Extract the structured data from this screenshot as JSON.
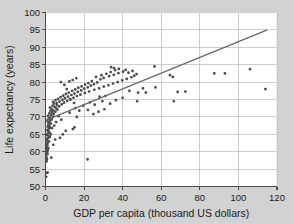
{
  "chart_data": {
    "type": "scatter",
    "title": "",
    "xlabel": "GDP per capita (thousand US dollars)",
    "ylabel": "Life expectancy (years)",
    "xlim": [
      0,
      120
    ],
    "ylim": [
      50,
      100
    ],
    "xticks": [
      0,
      20,
      40,
      60,
      80,
      100,
      120
    ],
    "yticks": [
      50,
      55,
      60,
      65,
      70,
      75,
      80,
      85,
      90,
      95,
      100
    ],
    "xtick_labels": [
      "0",
      "20",
      "40",
      "60",
      "80",
      "100",
      "120"
    ],
    "ytick_labels": [
      "50",
      "55",
      "60",
      "65",
      "70",
      "75",
      "80",
      "85",
      "90",
      "95",
      "100"
    ],
    "grid": true,
    "grid_color": "#b9b9b9",
    "point_color": "#4d4d4d",
    "trend_color": "#6a6a6a",
    "background_color": "#d2d2d2",
    "plot_background_color": "#ffffff",
    "trend_line": {
      "x": [
        0,
        115
      ],
      "y": [
        69.0,
        95.0
      ]
    },
    "points": [
      [
        0.4,
        52.8
      ],
      [
        0.6,
        53.9
      ],
      [
        1.1,
        54.0
      ],
      [
        0.5,
        57.2
      ],
      [
        0.7,
        58.0
      ],
      [
        0.4,
        58.6
      ],
      [
        0.9,
        59.3
      ],
      [
        0.6,
        60.1
      ],
      [
        1.2,
        60.4
      ],
      [
        0.8,
        60.9
      ],
      [
        0.5,
        61.4
      ],
      [
        1.0,
        61.8
      ],
      [
        0.7,
        62.3
      ],
      [
        1.4,
        62.7
      ],
      [
        0.9,
        63.2
      ],
      [
        0.6,
        63.6
      ],
      [
        1.3,
        64.0
      ],
      [
        1.8,
        64.4
      ],
      [
        0.8,
        64.8
      ],
      [
        1.1,
        65.2
      ],
      [
        2.1,
        65.5
      ],
      [
        1.5,
        65.9
      ],
      [
        0.9,
        66.2
      ],
      [
        1.7,
        66.6
      ],
      [
        2.4,
        66.9
      ],
      [
        1.2,
        67.2
      ],
      [
        2.0,
        67.5
      ],
      [
        1.4,
        67.8
      ],
      [
        2.8,
        68.1
      ],
      [
        1.9,
        68.4
      ],
      [
        1.1,
        68.7
      ],
      [
        2.5,
        69.0
      ],
      [
        3.2,
        69.3
      ],
      [
        1.6,
        69.5
      ],
      [
        2.2,
        69.8
      ],
      [
        3.8,
        70.1
      ],
      [
        1.3,
        70.3
      ],
      [
        2.9,
        70.6
      ],
      [
        4.3,
        70.8
      ],
      [
        2.0,
        71.0
      ],
      [
        3.5,
        71.3
      ],
      [
        5.1,
        71.5
      ],
      [
        2.6,
        71.7
      ],
      [
        4.0,
        71.9
      ],
      [
        6.2,
        72.1
      ],
      [
        3.1,
        72.3
      ],
      [
        5.5,
        72.5
      ],
      [
        2.3,
        72.7
      ],
      [
        4.7,
        72.9
      ],
      [
        7.1,
        73.0
      ],
      [
        3.6,
        73.2
      ],
      [
        6.0,
        73.4
      ],
      [
        8.4,
        73.6
      ],
      [
        4.4,
        73.8
      ],
      [
        5.8,
        73.9
      ],
      [
        9.6,
        74.1
      ],
      [
        3.9,
        74.3
      ],
      [
        7.3,
        74.4
      ],
      [
        11.2,
        74.6
      ],
      [
        5.2,
        74.8
      ],
      [
        8.8,
        74.9
      ],
      [
        12.8,
        75.1
      ],
      [
        6.5,
        75.2
      ],
      [
        10.1,
        75.4
      ],
      [
        14.5,
        75.5
      ],
      [
        7.8,
        75.7
      ],
      [
        11.7,
        75.8
      ],
      [
        16.3,
        76.0
      ],
      [
        9.2,
        76.1
      ],
      [
        13.4,
        76.3
      ],
      [
        18.1,
        76.4
      ],
      [
        10.6,
        76.6
      ],
      [
        15.0,
        76.7
      ],
      [
        20.4,
        76.9
      ],
      [
        12.1,
        77.0
      ],
      [
        16.8,
        77.2
      ],
      [
        22.6,
        77.3
      ],
      [
        13.8,
        77.5
      ],
      [
        18.5,
        77.6
      ],
      [
        25.3,
        77.8
      ],
      [
        15.4,
        77.9
      ],
      [
        20.1,
        78.1
      ],
      [
        27.8,
        78.2
      ],
      [
        17.0,
        78.4
      ],
      [
        21.9,
        78.5
      ],
      [
        30.2,
        78.7
      ],
      [
        18.7,
        78.8
      ],
      [
        23.5,
        79.0
      ],
      [
        32.6,
        79.1
      ],
      [
        20.5,
        79.3
      ],
      [
        25.1,
        79.4
      ],
      [
        35.0,
        79.6
      ],
      [
        22.2,
        79.7
      ],
      [
        26.8,
        79.9
      ],
      [
        37.4,
        80.0
      ],
      [
        12.4,
        80.2
      ],
      [
        24.0,
        80.3
      ],
      [
        39.8,
        80.5
      ],
      [
        14.1,
        80.6
      ],
      [
        28.5,
        80.8
      ],
      [
        42.1,
        80.9
      ],
      [
        16.0,
        81.1
      ],
      [
        30.1,
        81.2
      ],
      [
        44.5,
        81.4
      ],
      [
        26.2,
        81.5
      ],
      [
        33.0,
        81.7
      ],
      [
        46.0,
        81.8
      ],
      [
        29.0,
        82.0
      ],
      [
        35.4,
        82.1
      ],
      [
        47.2,
        82.3
      ],
      [
        31.5,
        82.4
      ],
      [
        37.8,
        82.6
      ],
      [
        43.0,
        82.7
      ],
      [
        33.8,
        82.9
      ],
      [
        40.2,
        83.0
      ],
      [
        45.1,
        83.2
      ],
      [
        36.1,
        83.4
      ],
      [
        41.5,
        83.5
      ],
      [
        38.0,
        83.8
      ],
      [
        35.5,
        84.0
      ],
      [
        34.0,
        84.3
      ],
      [
        56.5,
        84.5
      ],
      [
        8.0,
        80.0
      ],
      [
        9.8,
        79.2
      ],
      [
        11.0,
        78.0
      ],
      [
        13.0,
        75.0
      ],
      [
        14.8,
        74.0
      ],
      [
        15.5,
        72.5
      ],
      [
        16.2,
        70.0
      ],
      [
        15.0,
        67.0
      ],
      [
        14.2,
        66.5
      ],
      [
        10.5,
        66.0
      ],
      [
        9.0,
        65.0
      ],
      [
        7.5,
        64.0
      ],
      [
        5.0,
        63.5
      ],
      [
        4.0,
        62.0
      ],
      [
        3.0,
        58.3
      ],
      [
        21.8,
        57.8
      ],
      [
        24.8,
        70.8
      ],
      [
        27.5,
        71.5
      ],
      [
        22.0,
        72.0
      ],
      [
        25.5,
        73.5
      ],
      [
        29.5,
        74.5
      ],
      [
        31.0,
        76.0
      ],
      [
        47.5,
        74.5
      ],
      [
        52.0,
        77.0
      ],
      [
        57.0,
        78.5
      ],
      [
        64.5,
        82.0
      ],
      [
        66.0,
        81.5
      ],
      [
        66.5,
        74.5
      ],
      [
        68.5,
        77.2
      ],
      [
        72.5,
        77.3
      ],
      [
        87.5,
        82.5
      ],
      [
        93.0,
        82.5
      ],
      [
        106.0,
        83.7
      ],
      [
        114.0,
        78.0
      ],
      [
        50.5,
        78.2
      ],
      [
        48.0,
        77.0
      ],
      [
        43.5,
        77.5
      ],
      [
        40.0,
        75.5
      ],
      [
        36.5,
        74.8
      ],
      [
        33.5,
        73.8
      ],
      [
        30.5,
        72.2
      ],
      [
        28.0,
        75.8
      ],
      [
        23.0,
        74.2
      ],
      [
        19.5,
        73.2
      ],
      [
        17.5,
        71.8
      ],
      [
        12.5,
        71.2
      ],
      [
        6.8,
        70.2
      ],
      [
        8.2,
        69.2
      ],
      [
        5.5,
        68.5
      ],
      [
        4.5,
        67.5
      ],
      [
        3.4,
        66.8
      ],
      [
        2.7,
        65.0
      ],
      [
        2.2,
        64.2
      ],
      [
        1.8,
        63.0
      ],
      [
        1.5,
        61.0
      ],
      [
        1.0,
        59.5
      ],
      [
        0.7,
        57.8
      ]
    ]
  }
}
